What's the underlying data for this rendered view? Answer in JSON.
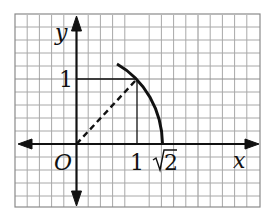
{
  "figure": {
    "type": "coordinate-plane-diagram",
    "grid": {
      "minor_per_unit": 5,
      "color": "#9a9a9a",
      "border_color": "#7a7a7a"
    },
    "axes": {
      "x_label": "x",
      "y_label": "y",
      "origin_label": "O",
      "x_ticks": [
        "1",
        "√2"
      ],
      "y_ticks": [
        "1"
      ]
    },
    "elements": [
      {
        "name": "quarter-circle-arc",
        "description": "arc of circle radius √2 centered at origin, from about 45°+ to the x-axis",
        "style": "solid thick"
      },
      {
        "name": "radius-segment",
        "description": "dashed segment from origin (0,0) to (1,1)",
        "style": "dashed"
      },
      {
        "name": "projection-horizontal",
        "description": "segment from (0,1) to (1,1)",
        "style": "thin solid"
      },
      {
        "name": "projection-vertical",
        "description": "segment from (1,1) down to (1,0)",
        "style": "thin solid"
      }
    ],
    "colors": {
      "ink": "#111111",
      "grid": "#9a9a9a",
      "background": "#ffffff"
    }
  },
  "labels": {
    "y": "y",
    "x": "x",
    "origin": "O",
    "one_x": "1",
    "sqrt2_x": "2",
    "one_y": "1"
  }
}
